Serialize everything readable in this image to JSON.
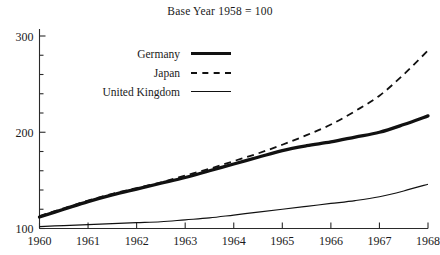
{
  "subtitle": "Base Year 1958 = 100",
  "cropped_title": "",
  "legend": {
    "items": [
      {
        "label": "Germany",
        "style": "thick-solid",
        "color": "#111111"
      },
      {
        "label": "Japan",
        "style": "dashed",
        "color": "#111111"
      },
      {
        "label": "United Kingdom",
        "style": "thin-solid",
        "color": "#111111"
      }
    ]
  },
  "axes": {
    "y_major_labels": [
      "100",
      "200",
      "300"
    ],
    "x_labels": [
      "1960",
      "1961",
      "1962",
      "1963",
      "1964",
      "1965",
      "1966",
      "1967",
      "1968"
    ]
  },
  "chart_data": {
    "type": "line",
    "title": "",
    "subtitle": "Base Year 1958 = 100",
    "xlabel": "",
    "ylabel": "",
    "xlim": [
      1960,
      1968
    ],
    "ylim": [
      100,
      300
    ],
    "y_major_ticks": [
      100,
      200,
      300
    ],
    "y_minor_tick_step": 20,
    "x_ticks": [
      1960,
      1961,
      1962,
      1963,
      1964,
      1965,
      1966,
      1967,
      1968
    ],
    "grid": false,
    "legend_position": "upper-left",
    "x": [
      1960,
      1960.5,
      1961,
      1961.5,
      1962,
      1962.5,
      1963,
      1963.5,
      1964,
      1964.5,
      1965,
      1965.5,
      1966,
      1966.5,
      1967,
      1967.5,
      1968
    ],
    "series": [
      {
        "name": "Germany",
        "style": "thick-solid",
        "color": "#111111",
        "values": [
          112,
          120,
          128,
          135,
          141,
          147,
          153,
          160,
          167,
          174,
          181,
          186,
          190,
          195,
          200,
          208,
          217
        ]
      },
      {
        "name": "Japan",
        "style": "dashed",
        "color": "#111111",
        "values": [
          113,
          121,
          129,
          136,
          142,
          148,
          155,
          162,
          170,
          178,
          187,
          197,
          208,
          222,
          238,
          260,
          285
        ]
      },
      {
        "name": "United Kingdom",
        "style": "thin-solid",
        "color": "#111111",
        "values": [
          102,
          103,
          104,
          105,
          106,
          107,
          109,
          111,
          114,
          117,
          120,
          123,
          126,
          129,
          133,
          139,
          146
        ]
      }
    ]
  }
}
